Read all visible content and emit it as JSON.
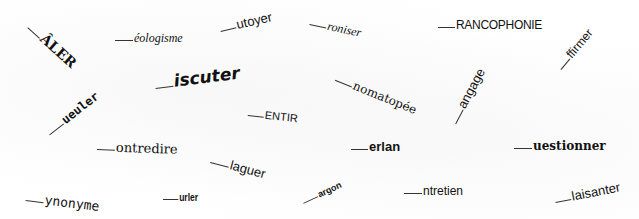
{
  "puzzle": {
    "words": [
      {
        "text": "ÂLER",
        "blank": 16
      },
      {
        "text": "éologisme",
        "blank": 24
      },
      {
        "text": "utoyer",
        "blank": 18
      },
      {
        "text": "roniser",
        "blank": 18
      },
      {
        "text": "RANCOPHONIE",
        "blank": 18
      },
      {
        "text": "ffirmer",
        "blank": 14
      },
      {
        "text": "iscuter",
        "blank": 18
      },
      {
        "text": "ueuler",
        "blank": 18
      },
      {
        "text": "nomatopée",
        "blank": 18
      },
      {
        "text": "angage",
        "blank": 16
      },
      {
        "text": "ENTIR",
        "blank": 18
      },
      {
        "text": "ontredire",
        "blank": 18
      },
      {
        "text": "laguer",
        "blank": 20
      },
      {
        "text": "erlan",
        "blank": 18
      },
      {
        "text": "uestionner",
        "blank": 18
      },
      {
        "text": "ynonyme",
        "blank": 18
      },
      {
        "text": "urler",
        "blank": 18
      },
      {
        "text": "argon",
        "blank": 18
      },
      {
        "text": "ntretien",
        "blank": 20
      },
      {
        "text": "laisanter",
        "blank": 18
      }
    ]
  }
}
